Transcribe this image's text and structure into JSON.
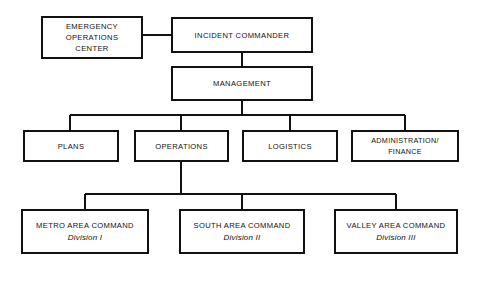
{
  "diagram": {
    "type": "organizational-chart",
    "background_color": "#ffffff",
    "line_color": "#111111",
    "box_fill": "#ffffff",
    "nodes": {
      "eoc": {
        "id": "emergency-operations-center",
        "line1": "EMERGENCY",
        "line2": "OPERATIONS",
        "line3": "CENTER",
        "x": 42,
        "y": 17,
        "w": 100,
        "h": 41
      },
      "incident_commander": {
        "id": "incident-commander",
        "line1": "INCIDENT COMMANDER",
        "x": 172,
        "y": 18,
        "w": 140,
        "h": 34
      },
      "management": {
        "id": "management",
        "line1": "MANAGEMENT",
        "x": 172,
        "y": 67,
        "w": 140,
        "h": 33
      },
      "plans": {
        "id": "plans",
        "line1": "PLANS",
        "x": 24,
        "y": 131,
        "w": 94,
        "h": 30
      },
      "operations": {
        "id": "operations",
        "line1": "OPERATIONS",
        "x": 135,
        "y": 131,
        "w": 93,
        "h": 30
      },
      "logistics": {
        "id": "logistics",
        "line1": "LOGISTICS",
        "x": 243,
        "y": 131,
        "w": 94,
        "h": 30
      },
      "administration_finance": {
        "id": "administration-finance",
        "line1": "ADMINISTRATION/",
        "line2": "FINANCE",
        "x": 352,
        "y": 131,
        "w": 106,
        "h": 30
      },
      "metro_area_command": {
        "id": "metro-area-command",
        "line1": "METRO AREA COMMAND",
        "sublabel": "Division I",
        "x": 22,
        "y": 210,
        "w": 126,
        "h": 43
      },
      "south_area_command": {
        "id": "south-area-command",
        "line1": "SOUTH AREA COMMAND",
        "sublabel": "Division II",
        "x": 180,
        "y": 210,
        "w": 124,
        "h": 43
      },
      "valley_area_command": {
        "id": "valley-area-command",
        "line1": "VALLEY AREA COMMAND",
        "sublabel": "Division III",
        "x": 335,
        "y": 210,
        "w": 122,
        "h": 43
      }
    },
    "connectors": [
      {
        "name": "eoc-to-incident-commander",
        "points": "142,35 172,35"
      },
      {
        "name": "incident-commander-to-management",
        "points": "242,52 242,67"
      },
      {
        "name": "management-stem-down",
        "points": "242,100 242,115"
      },
      {
        "name": "management-horizontal-bus",
        "points": "70,115 405,115"
      },
      {
        "name": "bus-drop-plans",
        "points": "70,115 70,131"
      },
      {
        "name": "bus-drop-operations",
        "points": "181,115 181,131"
      },
      {
        "name": "bus-drop-logistics",
        "points": "290,115 290,131"
      },
      {
        "name": "bus-drop-administration",
        "points": "405,115 405,131"
      },
      {
        "name": "operations-stem-down",
        "points": "181,161 181,194"
      },
      {
        "name": "operations-horizontal-bus",
        "points": "85,194 396,194"
      },
      {
        "name": "bus-drop-metro",
        "points": "85,194 85,210"
      },
      {
        "name": "bus-drop-south",
        "points": "242,194 242,210"
      },
      {
        "name": "bus-drop-valley",
        "points": "396,194 396,210"
      }
    ]
  }
}
